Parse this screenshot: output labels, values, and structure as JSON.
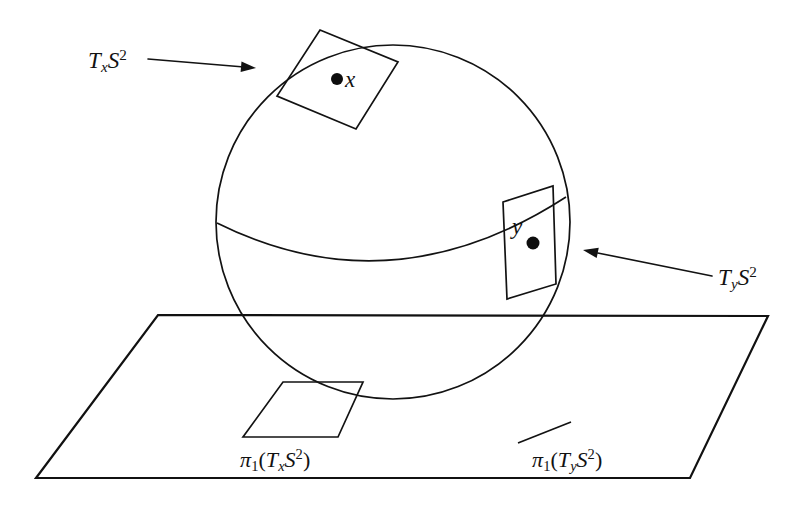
{
  "figure": {
    "background_color": "#ffffff",
    "ink_color": "#121212",
    "width": 806,
    "height": 505
  },
  "labels": {
    "tangent_x": {
      "name": "T_xS^2",
      "base": "T",
      "sub": "x",
      "operand": "S",
      "sup": "2",
      "text": "TxS2"
    },
    "tangent_y": {
      "name": "T_yS^2",
      "base": "T",
      "sub": "y",
      "operand": "S",
      "sup": "2",
      "text": "TyS2"
    },
    "projection_x": {
      "name": "pi_1(T_xS^2)",
      "pi": "π",
      "pi_sub": "1",
      "open": "(",
      "base": "T",
      "sub": "x",
      "operand": "S",
      "sup": "2",
      "close": ")"
    },
    "projection_y": {
      "name": "pi_1(T_yS^2)",
      "pi": "π",
      "pi_sub": "1",
      "open": "(",
      "base": "T",
      "sub": "y",
      "operand": "S",
      "sup": "2",
      "close": ")"
    },
    "point_x": {
      "text": "x"
    },
    "point_y": {
      "text": "y"
    }
  },
  "geometry": {
    "sphere": {
      "shape": "circle",
      "center_x": 393,
      "center_y": 222,
      "radius": 177
    },
    "equator": {
      "shape": "arc",
      "start_x": 217,
      "start_y": 223,
      "end_x": 566,
      "end_y": 197,
      "sag": 100
    },
    "tangent_plane_x": {
      "shape": "quadrilateral",
      "points": "320,30 398,62 356,129 277,96"
    },
    "tangent_plane_y": {
      "shape": "quadrilateral",
      "points": "503,202 553,186 556,284 507,299"
    },
    "base_plane": {
      "shape": "parallelogram",
      "points": "158,315 768,316 690,478 36,478"
    },
    "projection_x_quad": {
      "shape": "parallelogram",
      "points": "283,382 363,382 338,437 243,437"
    },
    "projection_y_segment": {
      "shape": "line",
      "x1": 518,
      "y1": 443,
      "x2": 571,
      "y2": 422
    },
    "dot_x": {
      "cx": 337,
      "cy": 79,
      "r": 6
    },
    "dot_y": {
      "cx": 533,
      "cy": 243,
      "r": 6.5
    },
    "arrow_to_tangent_x": {
      "direction": "right",
      "x1": 148,
      "y1": 59,
      "x2": 256,
      "y2": 68
    },
    "arrow_to_tangent_y": {
      "direction": "left",
      "x1": 712,
      "y1": 276,
      "x2": 583,
      "y2": 250
    }
  }
}
